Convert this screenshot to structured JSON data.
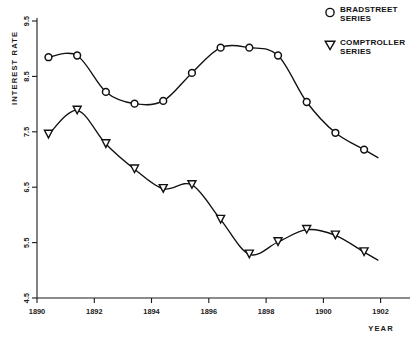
{
  "chart_data": {
    "type": "line",
    "title": "",
    "xlabel": "YEAR",
    "ylabel": "INTEREST RATE",
    "xlim": [
      1889.6,
      1902.6
    ],
    "ylim": [
      4.5,
      9.5
    ],
    "xticks": [
      1890,
      1892,
      1894,
      1896,
      1898,
      1900,
      1902
    ],
    "xtick_labels": [
      "1890",
      "1892",
      "1894",
      "1896",
      "1898",
      "1900",
      "1902"
    ],
    "yticks": [
      4.5,
      5.5,
      6.5,
      7.5,
      8.5,
      9.5
    ],
    "ytick_labels": [
      "4.5",
      "5.5",
      "6.5",
      "7.5",
      "8.5",
      "9.5"
    ],
    "grid": false,
    "legend_position": "top-right",
    "x": [
      1890,
      1891,
      1892,
      1893,
      1894,
      1895,
      1896,
      1897,
      1898,
      1899,
      1900,
      1901
    ],
    "series": [
      {
        "name": "BRADSTREET SERIES",
        "marker": "circle",
        "values": [
          8.8,
          8.83,
          8.18,
          7.97,
          8.02,
          8.52,
          8.97,
          8.97,
          8.83,
          8.0,
          7.45,
          7.15
        ]
      },
      {
        "name": "COMPTROLLER SERIES",
        "marker": "triangle-down",
        "values": [
          7.42,
          7.85,
          7.25,
          6.8,
          6.45,
          6.52,
          5.9,
          5.28,
          5.5,
          5.72,
          5.62,
          5.32
        ]
      }
    ],
    "colors": {
      "axis": "#1a1a1a",
      "line": "#111111",
      "marker_fill": "#ffffff",
      "background": "#ffffff"
    }
  },
  "legend": {
    "entries": [
      {
        "label_line1": "BRADSTREET",
        "label_line2": "SERIES",
        "marker": "circle-marker-icon"
      },
      {
        "label_line1": "COMPTROLLER",
        "label_line2": "SERIES",
        "marker": "triangle-down-marker-icon"
      }
    ]
  },
  "axes": {
    "y_title": "INTEREST RATE",
    "x_title": "YEAR"
  }
}
